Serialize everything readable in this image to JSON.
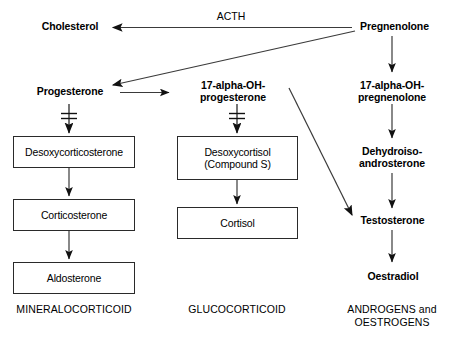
{
  "diagram": {
    "stroke_color": "#2a2a2a",
    "text_color": "#000000",
    "background_color": "#ffffff",
    "nodes": {
      "cholesterol": "Cholesterol",
      "pregnenolone": "Pregnenolone",
      "progesterone": "Progesterone",
      "hydroxyprogesterone": "17-alpha-OH-\nprogesterone",
      "hydroxypregnenolone": "17-alpha-OH-\npregnenolone",
      "desoxycorticosterone": "Desoxycorticosterone",
      "desoxycortisol": "Desoxycortisol\n(Compound S)",
      "dehydroisoandrosterone": "Dehydroiso-\nandrosterone",
      "corticosterone": "Corticosterone",
      "cortisol": "Cortisol",
      "testosterone": "Testosterone",
      "aldosterone": "Aldosterone",
      "oestradiol": "Oestradiol"
    },
    "edge_labels": {
      "acth": "ACTH"
    },
    "categories": {
      "mineralocorticoid": "MINERALOCORTICOID",
      "glucocorticoid": "GLUCOCORTICOID",
      "androgens_oestrogens": "ANDROGENS and\nOESTROGENS"
    }
  }
}
